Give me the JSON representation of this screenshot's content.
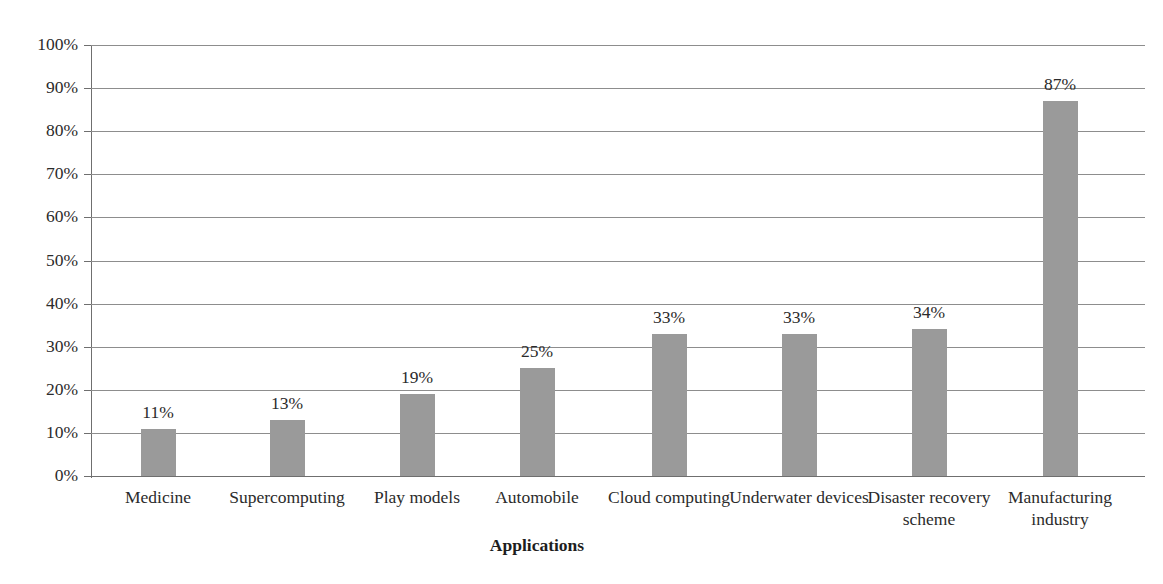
{
  "chart_data": {
    "type": "bar",
    "title": "",
    "xlabel": "Applications",
    "ylabel": "",
    "categories": [
      "Medicine",
      "Supercomputing",
      "Play models",
      "Automobile",
      "Cloud computing",
      "Underwater devices",
      "Disaster recovery scheme",
      "Manufacturing industry"
    ],
    "values": [
      11,
      13,
      19,
      25,
      33,
      33,
      34,
      87
    ],
    "value_labels": [
      "11%",
      "13%",
      "19%",
      "25%",
      "33%",
      "33%",
      "34%",
      "87%"
    ],
    "ylim": [
      0,
      100
    ],
    "ytick_labels": [
      "0%",
      "10%",
      "20%",
      "30%",
      "40%",
      "50%",
      "60%",
      "70%",
      "80%",
      "90%",
      "100%"
    ],
    "ytick_values": [
      0,
      10,
      20,
      30,
      40,
      50,
      60,
      70,
      80,
      90,
      100
    ],
    "grid": true,
    "legend": false,
    "bar_color": "#9a9a9a",
    "grid_color": "#8d8d8d",
    "axis_color": "#6f6f6f",
    "background": "#ffffff"
  }
}
